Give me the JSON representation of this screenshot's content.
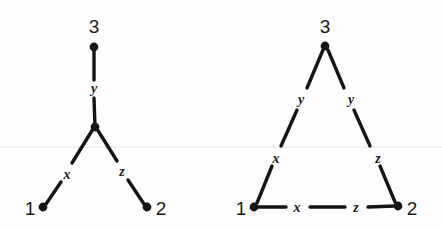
{
  "figure": {
    "background_color": "#fefefe",
    "ink_color": "#151515",
    "scan_artifact": {
      "name": "horizontal-scan-line",
      "y": 147,
      "color": "#ebebeb"
    },
    "diagrams": [
      {
        "id": "left",
        "name": "star-tree-diagram",
        "caption": "",
        "nodes": [
          {
            "id": "n3",
            "label": "3",
            "cx": 94,
            "cy": 47,
            "label_x": 94,
            "label_y": 33
          },
          {
            "id": "center",
            "label": "",
            "cx": 95,
            "cy": 127,
            "label_x": 0,
            "label_y": 0
          },
          {
            "id": "n1",
            "label": "1",
            "cx": 43,
            "cy": 207,
            "label_x": 30,
            "label_y": 215
          },
          {
            "id": "n2",
            "label": "2",
            "cx": 147,
            "cy": 207,
            "label_x": 161,
            "label_y": 215
          }
        ],
        "edges": [
          {
            "id": "e-y",
            "label": "y",
            "from": "n3",
            "to": "center",
            "label_x": 94,
            "label_y": 93,
            "segments": [
              [
                94,
                51,
                94,
                80
              ],
              [
                94,
                98,
                95,
                127
              ]
            ]
          },
          {
            "id": "e-x",
            "label": "x",
            "from": "center",
            "to": "n1",
            "label_x": 67,
            "label_y": 179,
            "segments": [
              [
                93,
                129,
                72,
                163
              ],
              [
                61,
                182,
                46,
                204
              ]
            ]
          },
          {
            "id": "e-z",
            "label": "z",
            "from": "center",
            "to": "n2",
            "label_x": 122,
            "label_y": 176,
            "segments": [
              [
                97,
                129,
                117,
                161
              ],
              [
                128,
                180,
                144,
                204
              ]
            ]
          }
        ]
      },
      {
        "id": "right",
        "name": "triangle-diagram",
        "caption": "",
        "nodes": [
          {
            "id": "n3",
            "label": "3",
            "cx": 325,
            "cy": 46,
            "label_x": 325,
            "label_y": 33
          },
          {
            "id": "n1",
            "label": "1",
            "cx": 254,
            "cy": 207,
            "label_x": 241,
            "label_y": 215
          },
          {
            "id": "n2",
            "label": "2",
            "cx": 398,
            "cy": 206,
            "label_x": 412,
            "label_y": 215
          }
        ],
        "edges": [
          {
            "id": "e-y-left",
            "label": "y",
            "from": "n3",
            "to": "n1",
            "label_x": 301,
            "label_y": 104,
            "segments": [
              [
                323,
                50,
                307,
                88
              ],
              [
                297,
                110,
                281,
                146
              ]
            ]
          },
          {
            "id": "e-y-right",
            "label": "y",
            "from": "n3",
            "to": "n2",
            "label_x": 351,
            "label_y": 104,
            "segments": [
              [
                328,
                50,
                344,
                88
              ],
              [
                354,
                110,
                370,
                146
              ]
            ]
          },
          {
            "id": "e-x-left",
            "label": "x",
            "from": "n1",
            "to": "apex-left",
            "label_x": 276,
            "label_y": 163,
            "segments": [
              [
                272,
                166,
                257,
                203
              ]
            ]
          },
          {
            "id": "e-z-right",
            "label": "z",
            "from": "n2",
            "to": "apex-right",
            "label_x": 378,
            "label_y": 163,
            "segments": [
              [
                380,
                166,
                395,
                202
              ]
            ]
          },
          {
            "id": "e-x-bottom",
            "label": "x",
            "from": "n1",
            "to": "mid",
            "label_x": 297,
            "label_y": 212,
            "segments": [
              [
                258,
                207,
                286,
                207
              ]
            ]
          },
          {
            "id": "e-z-bottom",
            "label": "z",
            "from": "mid",
            "to": "n2",
            "label_x": 356,
            "label_y": 212,
            "segments": [
              [
                310,
                207,
                345,
                207
              ],
              [
                368,
                207,
                395,
                206
              ]
            ]
          }
        ]
      }
    ],
    "node_labels": [
      "1",
      "2",
      "3"
    ],
    "edge_labels": [
      "x",
      "y",
      "z"
    ]
  }
}
